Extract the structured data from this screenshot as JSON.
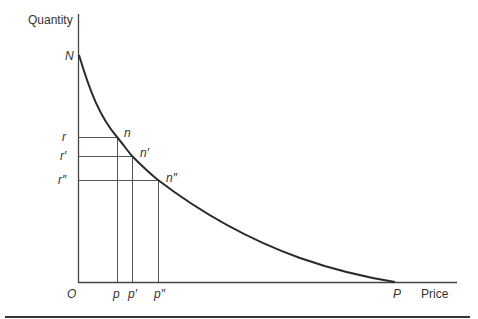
{
  "diagram": {
    "y_axis_label": "Quantity",
    "x_axis_label": "Price",
    "origin_label": "O",
    "y_intercept_label": "N",
    "x_intercept_label": "P",
    "y_tick_labels": [
      "r",
      "r′",
      "r″"
    ],
    "x_tick_labels": [
      "p",
      "p′",
      "p″"
    ],
    "point_labels": [
      "n",
      "n′",
      "n″"
    ],
    "colors": {
      "line": "#2b2b2b",
      "grid": "#555555",
      "text": "#333333"
    }
  }
}
